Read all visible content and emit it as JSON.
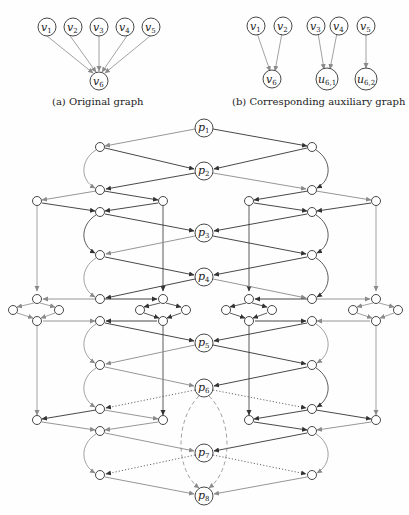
{
  "figure": {
    "subfigures": [
      {
        "id": "a",
        "caption": "(a) Original graph",
        "nodes": [
          "v1",
          "v2",
          "v3",
          "v4",
          "v5",
          "v6"
        ],
        "node_labels": {
          "v1": {
            "base": "v",
            "sub": "1"
          },
          "v2": {
            "base": "v",
            "sub": "2"
          },
          "v3": {
            "base": "v",
            "sub": "3"
          },
          "v4": {
            "base": "v",
            "sub": "4"
          },
          "v5": {
            "base": "v",
            "sub": "5"
          },
          "v6": {
            "base": "v",
            "sub": "6"
          }
        },
        "edges": [
          [
            "v1",
            "v6"
          ],
          [
            "v2",
            "v6"
          ],
          [
            "v3",
            "v6"
          ],
          [
            "v4",
            "v6"
          ],
          [
            "v5",
            "v6"
          ]
        ]
      },
      {
        "id": "b",
        "caption": "(b) Corresponding auxiliary graph",
        "nodes": [
          "v1",
          "v2",
          "v3",
          "v4",
          "v5",
          "v6",
          "u6,1",
          "u6,2"
        ],
        "node_labels": {
          "v1": {
            "base": "v",
            "sub": "1"
          },
          "v2": {
            "base": "v",
            "sub": "2"
          },
          "v3": {
            "base": "v",
            "sub": "3"
          },
          "v4": {
            "base": "v",
            "sub": "4"
          },
          "v5": {
            "base": "v",
            "sub": "5"
          },
          "v6": {
            "base": "v",
            "sub": "6"
          },
          "u61": {
            "base": "u",
            "sub": "6,1"
          },
          "u62": {
            "base": "u",
            "sub": "6,2"
          }
        },
        "edges": [
          [
            "v1",
            "v6"
          ],
          [
            "v2",
            "v6"
          ],
          [
            "v3",
            "u6,1"
          ],
          [
            "v4",
            "u6,1"
          ],
          [
            "v5",
            "u6,2"
          ]
        ]
      },
      {
        "id": "c",
        "caption": "",
        "main_nodes": [
          {
            "base": "p",
            "sub": "1"
          },
          {
            "base": "p",
            "sub": "2"
          },
          {
            "base": "p",
            "sub": "3"
          },
          {
            "base": "p",
            "sub": "4"
          },
          {
            "base": "p",
            "sub": "5"
          },
          {
            "base": "p",
            "sub": "6"
          },
          {
            "base": "p",
            "sub": "7"
          },
          {
            "base": "p",
            "sub": "8"
          }
        ],
        "notes": "Gadget network: path nodes p1..p8 along center, with unlabeled auxiliary nodes on left/right columns connected by black and gray arrows, diamond sub-gadgets, dotted edges from p6/p7, and dashed curved edges from p6 to p8."
      }
    ]
  },
  "colors": {
    "dark_edge": "#333333",
    "light_edge": "#8a8a8a",
    "node_stroke": "#333333",
    "background": "#fefefe"
  }
}
